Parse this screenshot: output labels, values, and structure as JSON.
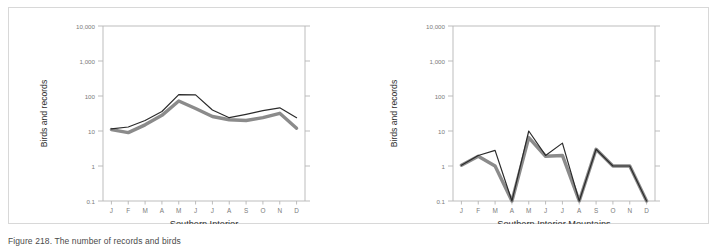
{
  "figure": {
    "panels": [
      {
        "id": "southern-interior",
        "xlabel": "Southern Interior",
        "ylabel": "Birds and records"
      },
      {
        "id": "southern-interior-mountains",
        "xlabel": "Southern Interior Mountains",
        "ylabel": "Birds and records"
      }
    ]
  },
  "chart_data": [
    {
      "type": "line",
      "title": "",
      "xlabel": "Southern Interior",
      "ylabel": "Birds and records",
      "yscale": "log",
      "ylim": [
        0.1,
        10000
      ],
      "yticks": [
        0.1,
        1,
        10,
        100,
        1000,
        10000
      ],
      "ytick_labels": [
        "0.1",
        "1",
        "10",
        "100",
        "1,000",
        "10,000"
      ],
      "categories": [
        "J",
        "F",
        "M",
        "A",
        "M",
        "J",
        "J",
        "A",
        "S",
        "O",
        "N",
        "D"
      ],
      "grid": false,
      "legend": "none",
      "series": [
        {
          "name": "records",
          "color": "#2b2b2b",
          "width": 1.2,
          "values": [
            11.5,
            13.0,
            20.0,
            36.0,
            110.0,
            108.0,
            40.0,
            24.0,
            30.0,
            38.0,
            46.0,
            24.0
          ]
        },
        {
          "name": "birds",
          "color": "#8b8b8b",
          "width": 3.4,
          "values": [
            11.0,
            9.0,
            15.0,
            28.0,
            72.0,
            44.0,
            26.0,
            21.0,
            20.0,
            24.0,
            32.0,
            12.0
          ]
        }
      ]
    },
    {
      "type": "line",
      "title": "",
      "xlabel": "Southern Interior Mountains",
      "ylabel": "Birds and records",
      "yscale": "log",
      "ylim": [
        0.1,
        10000
      ],
      "yticks": [
        0.1,
        1,
        10,
        100,
        1000,
        10000
      ],
      "ytick_labels": [
        "0.1",
        "1",
        "10",
        "100",
        "1,000",
        "10,000"
      ],
      "categories": [
        "J",
        "F",
        "M",
        "A",
        "M",
        "J",
        "J",
        "A",
        "S",
        "O",
        "N",
        "D"
      ],
      "grid": false,
      "legend": "none",
      "series": [
        {
          "name": "records",
          "color": "#2b2b2b",
          "width": 1.2,
          "values": [
            1.05,
            2.0,
            2.8,
            0.1,
            10.0,
            2.0,
            4.5,
            0.1,
            3.0,
            1.0,
            1.0,
            0.1
          ]
        },
        {
          "name": "birds",
          "color": "#8b8b8b",
          "width": 3.4,
          "values": [
            1.05,
            1.9,
            1.0,
            0.1,
            6.5,
            1.9,
            2.0,
            0.1,
            3.0,
            1.0,
            1.0,
            0.1
          ]
        }
      ]
    }
  ],
  "caption": {
    "text": "Figure 218. The number of records and birds"
  },
  "style": {
    "axis_color": "#b5b5b5",
    "tick_label_color": "#7a7a7a",
    "axis_title_color": "#2f2f2f",
    "frame_color": "#d8d8d8",
    "series_dark": "#2b2b2b",
    "series_gray": "#8b8b8b"
  }
}
